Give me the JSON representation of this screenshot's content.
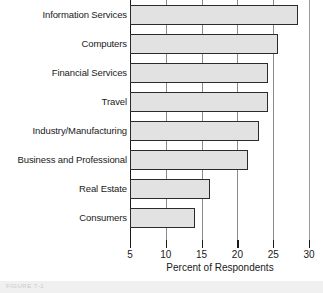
{
  "chart_data": {
    "type": "bar",
    "orientation": "horizontal",
    "title": "",
    "xlabel": "Percent of Respondents",
    "ylabel": "",
    "xlim": [
      5,
      30
    ],
    "ylim": null,
    "grid": true,
    "grid_axis": "x",
    "legend": null,
    "xticks": [
      5,
      10,
      15,
      20,
      25,
      30
    ],
    "xticklabels": [
      "5",
      "10",
      "15",
      "20",
      "25",
      "30"
    ],
    "categories": [
      "Information Services",
      "Computers",
      "Financial Services",
      "Travel",
      "Industry/Manufacturing",
      "Business and Professional",
      "Real Estate",
      "Consumers"
    ],
    "values": [
      28.4,
      25.7,
      24.3,
      24.3,
      23.0,
      21.5,
      16.2,
      14.1
    ],
    "bar_fill_color": "#e2e2e2",
    "bar_edge_color": "#2b2b2b",
    "axis_color": "#1a1a1a",
    "gridline_color": "#8a8a8a"
  },
  "caption": {
    "text": "FIGURE 7-1"
  }
}
